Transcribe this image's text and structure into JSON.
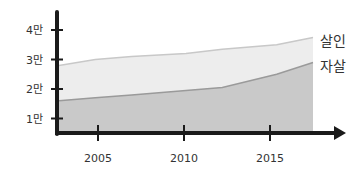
{
  "chart_data": {
    "type": "area",
    "title": "",
    "xlabel": "",
    "ylabel": "",
    "x": [
      2003,
      2005,
      2007,
      2010,
      2012,
      2015,
      2017
    ],
    "x_ticks": [
      2005,
      2010,
      2015
    ],
    "x_tick_labels": [
      "2005",
      "2010",
      "2015"
    ],
    "y_ticks": [
      1,
      2,
      3,
      4
    ],
    "y_tick_labels": [
      "1만",
      "2만",
      "3만",
      "4만"
    ],
    "ylim": [
      0.5,
      4.4
    ],
    "xlim": [
      2002.5,
      2018.5
    ],
    "grid": false,
    "legend_position": "inline-right",
    "series": [
      {
        "name": "살인",
        "values": [
          2.8,
          3.0,
          3.1,
          3.2,
          3.35,
          3.5,
          3.75
        ],
        "color": "#ededed",
        "line_color": "#c8c8c8"
      },
      {
        "name": "자살",
        "values": [
          1.6,
          1.7,
          1.8,
          1.95,
          2.05,
          2.5,
          2.9
        ],
        "color": "#c9c9c9",
        "line_color": "#9a9a9a"
      }
    ]
  }
}
